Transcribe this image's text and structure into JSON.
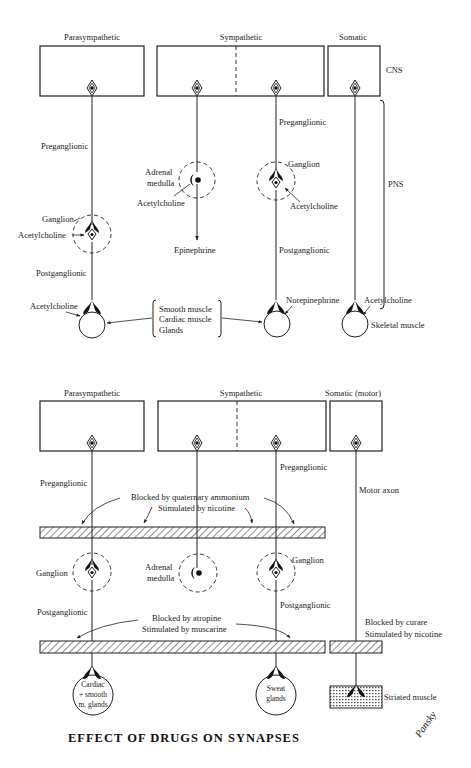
{
  "diagram": {
    "title": "EFFECT OF DRUGS ON SYNAPSES",
    "signature": "Pansky",
    "top_panel": {
      "columns": {
        "parasympathetic": "Parasympathetic",
        "sympathetic": "Sympathetic",
        "somatic": "Somatic"
      },
      "regions": {
        "cns": "CNS",
        "pns": "PNS"
      },
      "parasympathetic": {
        "preganglionic": "Preganglionic",
        "ganglion": "Ganglion",
        "ganglion_transmitter": "Acetylcholine",
        "postganglionic": "Postganglionic",
        "effector_transmitter": "Acetylcholine"
      },
      "sympathetic_adrenal": {
        "organ_line1": "Adrenal",
        "organ_line2": "medulla",
        "transmitter": "Acetylcholine",
        "output": "Epinephrine"
      },
      "sympathetic": {
        "preganglionic": "Preganglionic",
        "ganglion": "Ganglion",
        "ganglion_transmitter": "Acetylcholine",
        "postganglionic": "Postganglionic",
        "effector_transmitter": "Norepinephrine"
      },
      "somatic": {
        "effector_transmitter": "Acetylcholine",
        "effector": "Skeletal muscle"
      },
      "shared_effectors": [
        "Smooth muscle",
        "Cardiac muscle",
        "Glands"
      ]
    },
    "bottom_panel": {
      "columns": {
        "parasympathetic": "Parasympathetic",
        "sympathetic": "Sympathetic",
        "somatic": "Somatic (motor)"
      },
      "parasympathetic": {
        "preganglionic": "Preganglionic",
        "ganglion": "Ganglion",
        "postganglionic": "Postganglionic",
        "effector_lines": [
          "Cardiac",
          "+ smooth",
          "m. glands"
        ]
      },
      "sympathetic_adrenal": {
        "organ_line1": "Adrenal",
        "organ_line2": "medulla"
      },
      "sympathetic": {
        "preganglionic": "Preganglionic",
        "ganglion": "Ganglion",
        "postganglionic": "Postganglionic",
        "effector_lines": [
          "Sweat",
          "glands"
        ]
      },
      "somatic": {
        "axon": "Motor axon",
        "effector": "Striated muscle"
      },
      "ganglionic_block": {
        "line1": "Blocked by quaternary ammonium",
        "line2": "Stimulated by nicotine"
      },
      "muscarinic_block": {
        "line1": "Blocked by atropine",
        "line2": "Stimulated by muscarine"
      },
      "neuromuscular_block": {
        "line1": "Blocked by curare",
        "line2": "Stimulated by nicotine"
      }
    }
  }
}
